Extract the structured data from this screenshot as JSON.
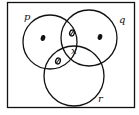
{
  "diagram": {
    "type": "venn",
    "sets": [
      {
        "name": "p",
        "label": "p",
        "cx": 50,
        "cy": 42,
        "r": 27,
        "label_pos": [
          26,
          20
        ]
      },
      {
        "name": "q",
        "label": "q",
        "cx": 89,
        "cy": 38,
        "r": 28,
        "label_pos": [
          120,
          22
        ]
      },
      {
        "name": "r",
        "label": "r",
        "cx": 74,
        "cy": 76,
        "r": 30,
        "label_pos": [
          99,
          101
        ]
      }
    ],
    "regions": [
      {
        "name": "p-only",
        "marker": "dot",
        "pos": [
          43,
          38
        ]
      },
      {
        "name": "p-and-q-only",
        "marker": "zero",
        "pos": [
          72,
          33
        ]
      },
      {
        "name": "q-only",
        "marker": "dot",
        "pos": [
          100,
          37
        ]
      },
      {
        "name": "p-and-r-only",
        "marker": "zero",
        "pos": [
          58,
          61
        ]
      },
      {
        "name": "p-q-r",
        "marker": "text",
        "text": "x",
        "pos": [
          74,
          51
        ]
      }
    ],
    "frame": {
      "x": 7,
      "y": 2,
      "width": 128,
      "height": 106
    },
    "stroke_color": "#111111"
  }
}
